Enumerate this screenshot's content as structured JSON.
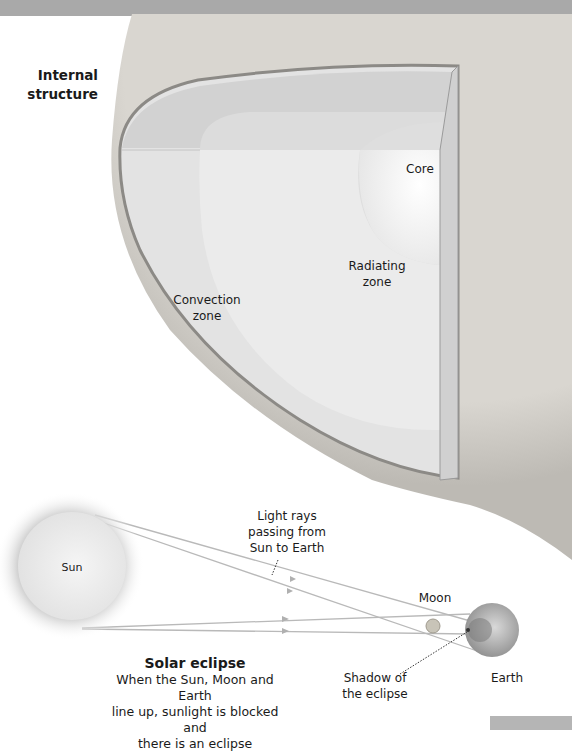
{
  "header": {
    "section_title": "Internal structure"
  },
  "cutaway": {
    "labels": {
      "core": "Core",
      "radiating_zone": "Radiating zone",
      "convection_zone": "Convection zone"
    }
  },
  "eclipse": {
    "bodies": {
      "sun": "Sun",
      "moon": "Moon",
      "earth": "Earth"
    },
    "annotations": {
      "light_rays": "Light rays passing from Sun to Earth",
      "light_rays_lines": [
        "Light rays",
        "passing from",
        "Sun to Earth"
      ],
      "shadow": "Shadow of the eclipse",
      "shadow_lines": [
        "Shadow of",
        "the eclipse"
      ]
    },
    "caption": {
      "title": "Solar eclipse",
      "body_lines": [
        "When the Sun, Moon and Earth",
        "line up, sunlight is blocked and",
        "there is an eclipse"
      ]
    }
  },
  "colors": {
    "background": "#ffffff",
    "top_band": "#a9a9a9",
    "rim_texture": "#c9c6c0",
    "convection": "#e4e4e4",
    "radiating": "#ececec",
    "core": "#f7f7f7",
    "ray": "#b8b8b8",
    "text": "#1a1a1a"
  }
}
